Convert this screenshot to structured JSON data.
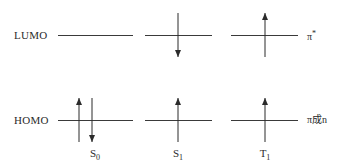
{
  "figure": {
    "kind": "molecular-orbital-energy-diagram",
    "background_color": "#ffffff",
    "line_color": "#3a3a3a",
    "arrow_color": "#2b2b2b",
    "text_color": "#2b2b2b"
  },
  "energy_levels": [
    {
      "id": "lumo",
      "label": "LUMO",
      "y": 35,
      "orbital_label": "π",
      "orbital_label_suffix": "*"
    },
    {
      "id": "homo",
      "label": "HOMO",
      "y": 120,
      "orbital_label": "π成n",
      "orbital_label_suffix": ""
    }
  ],
  "level_label_x": 14,
  "orbital_label_x": 307,
  "columns": [
    {
      "id": "s0",
      "label": "S",
      "subscript": "0",
      "center_x": 95,
      "line_left": 58,
      "line_right": 133,
      "label_center_x": 95,
      "electrons": {
        "lumo": [],
        "homo": [
          {
            "direction": "up",
            "x": 79
          },
          {
            "direction": "down",
            "x": 92
          }
        ]
      }
    },
    {
      "id": "s1",
      "label": "S",
      "subscript": "1",
      "center_x": 178,
      "line_left": 145,
      "line_right": 212,
      "label_center_x": 178,
      "electrons": {
        "lumo": [
          {
            "direction": "down",
            "x": 178
          }
        ],
        "homo": [
          {
            "direction": "up",
            "x": 178
          }
        ]
      }
    },
    {
      "id": "t1",
      "label": "T",
      "subscript": "1",
      "center_x": 265,
      "line_left": 231,
      "line_right": 298,
      "label_center_x": 265,
      "electrons": {
        "lumo": [
          {
            "direction": "up",
            "x": 265
          }
        ],
        "homo": [
          {
            "direction": "up",
            "x": 265
          }
        ]
      }
    }
  ],
  "state_label_y": 148,
  "arrow_geometry": {
    "length": 44,
    "head_length": 7,
    "head_half_width": 3,
    "shaft_width": 1
  }
}
